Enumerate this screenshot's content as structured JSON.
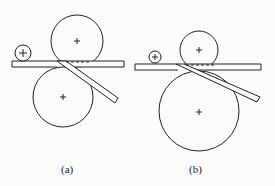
{
  "figure": {
    "panels": [
      {
        "label": "(a)",
        "description": "Equal-size bending rolls with small pinch roll; plate bent downward along lower roll"
      },
      {
        "label": "(b)",
        "description": "Small upper roll and large lower roll with small pinch roll; plate bent downward along lower roll"
      }
    ],
    "colors": {
      "stroke": "#222222",
      "background": "#fbfbfa"
    }
  }
}
